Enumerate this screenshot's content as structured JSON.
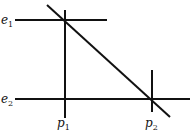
{
  "diagram": {
    "labels": {
      "e1": {
        "base": "e",
        "sub": "1"
      },
      "e2": {
        "base": "e",
        "sub": "2"
      },
      "p1": {
        "base": "p",
        "sub": "1"
      },
      "p2": {
        "base": "p",
        "sub": "2"
      }
    },
    "lines": [
      {
        "name": "e1-line",
        "x1": 15,
        "y1": 20,
        "x2": 107,
        "y2": 20
      },
      {
        "name": "e2-line",
        "x1": 15,
        "y1": 99,
        "x2": 190,
        "y2": 99
      },
      {
        "name": "p1-line",
        "x1": 65,
        "y1": 10,
        "x2": 65,
        "y2": 118
      },
      {
        "name": "p2-line",
        "x1": 152,
        "y1": 70,
        "x2": 152,
        "y2": 112
      },
      {
        "name": "diagonal-line",
        "x1": 47,
        "y1": 5,
        "x2": 170,
        "y2": 117
      }
    ],
    "stroke_color": "#111111"
  }
}
